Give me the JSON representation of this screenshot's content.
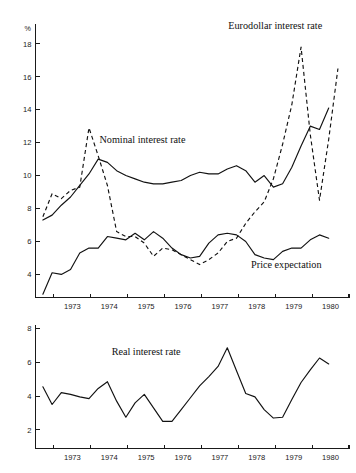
{
  "chart_data": [
    {
      "id": "upper",
      "type": "line",
      "title": "",
      "xlabel": "",
      "ylabel": "%",
      "ylim": [
        2.6,
        19.2
      ],
      "xlim": [
        1972.5,
        1981.0
      ],
      "grid": false,
      "legend_position": "inline-annotations",
      "ytick_labels": [
        "4",
        "6",
        "8",
        "10",
        "12",
        "14",
        "16",
        "18"
      ],
      "ytick_values": [
        4,
        6,
        8,
        10,
        12,
        14,
        16,
        18
      ],
      "xtick_labels": [
        "1973",
        "1974",
        "1975",
        "1976",
        "1977",
        "1978",
        "1979",
        "1980"
      ],
      "xtick_values": [
        1973,
        1974,
        1975,
        1976,
        1977,
        1978,
        1979,
        1980
      ],
      "annotations": [
        {
          "text": "Eurodollar interest rate",
          "x": 1979.0,
          "y": 18.9
        },
        {
          "text": "Nominal interest rate",
          "x": 1975.4,
          "y": 12.0
        },
        {
          "text": "Price expectation",
          "x": 1979.3,
          "y": 4.4
        }
      ],
      "series": [
        {
          "name": "Eurodollar interest rate",
          "style": "dashed",
          "x": [
            1972.7,
            1972.95,
            1973.2,
            1973.45,
            1973.7,
            1973.95,
            1974.2,
            1974.45,
            1974.7,
            1974.95,
            1975.2,
            1975.45,
            1975.7,
            1975.95,
            1976.2,
            1976.45,
            1976.7,
            1976.95,
            1977.2,
            1977.45,
            1977.7,
            1977.95,
            1978.2,
            1978.45,
            1978.7,
            1978.95,
            1979.2,
            1979.45,
            1979.7,
            1979.95,
            1980.2,
            1980.45,
            1980.7
          ],
          "y": [
            7.5,
            8.9,
            8.6,
            9.1,
            9.3,
            12.9,
            11.2,
            9.4,
            6.6,
            6.3,
            6.3,
            5.9,
            5.1,
            5.6,
            5.5,
            5.2,
            4.9,
            4.6,
            4.9,
            5.3,
            6.0,
            6.2,
            7.1,
            7.8,
            8.4,
            9.8,
            11.9,
            14.3,
            17.8,
            12.5,
            8.5,
            12.2,
            16.5
          ]
        },
        {
          "name": "Nominal interest rate",
          "style": "solid",
          "x": [
            1972.7,
            1972.95,
            1973.2,
            1973.45,
            1973.7,
            1973.95,
            1974.2,
            1974.45,
            1974.7,
            1974.95,
            1975.2,
            1975.45,
            1975.7,
            1975.95,
            1976.2,
            1976.45,
            1976.7,
            1976.95,
            1977.2,
            1977.45,
            1977.7,
            1977.95,
            1978.2,
            1978.45,
            1978.7,
            1978.95,
            1979.2,
            1979.45,
            1979.7,
            1979.95,
            1980.2,
            1980.45
          ],
          "y": [
            7.3,
            7.6,
            8.2,
            8.7,
            9.4,
            10.1,
            11.0,
            10.8,
            10.3,
            10.0,
            9.8,
            9.6,
            9.5,
            9.5,
            9.6,
            9.7,
            10.0,
            10.2,
            10.1,
            10.1,
            10.4,
            10.6,
            10.3,
            9.6,
            10.0,
            9.3,
            9.5,
            10.5,
            11.8,
            13.0,
            12.8,
            14.1
          ]
        },
        {
          "name": "Price expectation",
          "style": "solid",
          "x": [
            1972.7,
            1972.95,
            1973.2,
            1973.45,
            1973.7,
            1973.95,
            1974.2,
            1974.45,
            1974.7,
            1974.95,
            1975.2,
            1975.45,
            1975.7,
            1975.95,
            1976.2,
            1976.45,
            1976.7,
            1976.95,
            1977.2,
            1977.45,
            1977.7,
            1977.95,
            1978.2,
            1978.45,
            1978.7,
            1978.95,
            1979.2,
            1979.45,
            1979.7,
            1979.95,
            1980.2,
            1980.45
          ],
          "y": [
            2.8,
            4.1,
            4.0,
            4.3,
            5.3,
            5.6,
            5.6,
            6.3,
            6.2,
            6.1,
            6.5,
            6.1,
            6.6,
            6.2,
            5.6,
            5.2,
            5.0,
            5.1,
            5.9,
            6.4,
            6.5,
            6.4,
            6.0,
            5.2,
            5.0,
            4.9,
            5.4,
            5.6,
            5.6,
            6.1,
            6.4,
            6.2
          ]
        }
      ]
    },
    {
      "id": "lower",
      "type": "line",
      "title": "",
      "xlabel": "",
      "ylabel": "",
      "ylim": [
        0.9,
        8.2
      ],
      "xlim": [
        1972.5,
        1981.0
      ],
      "grid": false,
      "legend_position": "inline-annotations",
      "ytick_labels": [
        "2",
        "4",
        "6",
        "8"
      ],
      "ytick_values": [
        2,
        4,
        6,
        8
      ],
      "xtick_labels": [
        "1973",
        "1974",
        "1975",
        "1976",
        "1977",
        "1978",
        "1979",
        "1980"
      ],
      "xtick_values": [
        1973,
        1974,
        1975,
        1976,
        1977,
        1978,
        1979,
        1980
      ],
      "annotations": [
        {
          "text": "Real interest rate",
          "x": 1975.5,
          "y": 6.4
        }
      ],
      "series": [
        {
          "name": "Real interest rate",
          "style": "solid",
          "x": [
            1972.7,
            1972.95,
            1973.2,
            1973.45,
            1973.7,
            1973.95,
            1974.2,
            1974.45,
            1974.7,
            1974.95,
            1975.2,
            1975.45,
            1975.7,
            1975.95,
            1976.2,
            1976.45,
            1976.7,
            1976.95,
            1977.2,
            1977.45,
            1977.7,
            1977.95,
            1978.2,
            1978.45,
            1978.7,
            1978.95,
            1979.2,
            1979.45,
            1979.7,
            1979.95,
            1980.2,
            1980.45
          ],
          "y": [
            4.55,
            3.5,
            4.2,
            4.1,
            3.95,
            3.85,
            4.45,
            4.85,
            3.7,
            2.75,
            3.6,
            4.1,
            3.3,
            2.5,
            2.5,
            3.2,
            3.9,
            4.6,
            5.15,
            5.75,
            6.85,
            5.5,
            4.15,
            3.95,
            3.2,
            2.7,
            2.75,
            3.8,
            4.8,
            5.55,
            6.25,
            5.9
          ]
        }
      ]
    }
  ],
  "figure": {
    "unit_symbol": "%"
  }
}
